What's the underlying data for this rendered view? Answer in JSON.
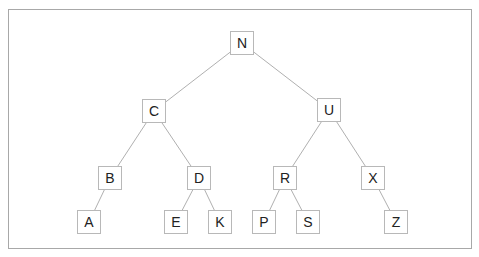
{
  "diagram": {
    "type": "binary-tree",
    "colors": {
      "edge": "#b0b0b0",
      "node_border": "#b8b8b8",
      "text": "#222222",
      "frame": "#a8a8a8"
    },
    "nodes": [
      {
        "id": "N",
        "label": "N",
        "x": 242,
        "y": 43
      },
      {
        "id": "C",
        "label": "C",
        "x": 154,
        "y": 111
      },
      {
        "id": "U",
        "label": "U",
        "x": 329,
        "y": 110
      },
      {
        "id": "B",
        "label": "B",
        "x": 110,
        "y": 178
      },
      {
        "id": "D",
        "label": "D",
        "x": 199,
        "y": 178
      },
      {
        "id": "R",
        "label": "R",
        "x": 285,
        "y": 178
      },
      {
        "id": "X",
        "label": "X",
        "x": 373,
        "y": 178
      },
      {
        "id": "A",
        "label": "A",
        "x": 89,
        "y": 222
      },
      {
        "id": "E",
        "label": "E",
        "x": 176,
        "y": 222
      },
      {
        "id": "K",
        "label": "K",
        "x": 220,
        "y": 222
      },
      {
        "id": "P",
        "label": "P",
        "x": 264,
        "y": 222
      },
      {
        "id": "S",
        "label": "S",
        "x": 308,
        "y": 222
      },
      {
        "id": "Z",
        "label": "Z",
        "x": 396,
        "y": 222
      }
    ],
    "edges": [
      [
        "N",
        "C"
      ],
      [
        "N",
        "U"
      ],
      [
        "C",
        "B"
      ],
      [
        "C",
        "D"
      ],
      [
        "U",
        "R"
      ],
      [
        "U",
        "X"
      ],
      [
        "B",
        "A"
      ],
      [
        "D",
        "E"
      ],
      [
        "D",
        "K"
      ],
      [
        "R",
        "P"
      ],
      [
        "R",
        "S"
      ],
      [
        "X",
        "Z"
      ]
    ]
  }
}
